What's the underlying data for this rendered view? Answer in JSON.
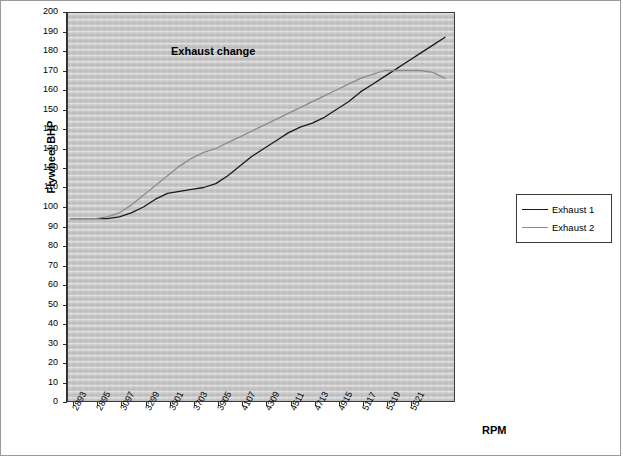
{
  "chart_data": {
    "type": "line",
    "title": "",
    "annotation": "Exhaust change",
    "xlabel": "RPM",
    "ylabel": "Flywheel BHP",
    "ylim": [
      0,
      200
    ],
    "ytick_step": 10,
    "yticks": [
      0,
      10,
      20,
      30,
      40,
      50,
      60,
      70,
      80,
      90,
      100,
      110,
      120,
      130,
      140,
      150,
      160,
      170,
      180,
      190,
      200
    ],
    "grid": false,
    "legend_position": "right",
    "categories": [
      "2893",
      "2895",
      "3097",
      "3299",
      "3501",
      "3703",
      "3905",
      "4107",
      "4309",
      "4511",
      "4713",
      "4915",
      "5117",
      "5319",
      "5521"
    ],
    "xtick_labels": [
      "2893",
      "2895",
      "3097",
      "3299",
      "3501",
      "3703",
      "3905",
      "4107",
      "4309",
      "4511",
      "4713",
      "4915",
      "5117",
      "5319",
      "5521"
    ],
    "series": [
      {
        "name": "Exhaust 1",
        "color": "#1a1a1a",
        "x": [
          0,
          1,
          2,
          3,
          4,
          5,
          6,
          7,
          8,
          9,
          10,
          11,
          12,
          13,
          14,
          15,
          16,
          17,
          18,
          19,
          20,
          21,
          22,
          23,
          24,
          25,
          26,
          27,
          28,
          29,
          30,
          31
        ],
        "values": [
          94,
          94,
          94,
          94,
          95,
          97,
          100,
          104,
          107,
          108,
          109,
          110,
          112,
          116,
          121,
          126,
          130,
          134,
          138,
          141,
          143,
          146,
          150,
          154,
          159,
          163,
          167,
          171,
          175,
          179,
          183,
          187
        ]
      },
      {
        "name": "Exhaust 2",
        "color": "#8c8c8c",
        "x": [
          0,
          1,
          2,
          3,
          4,
          5,
          6,
          7,
          8,
          9,
          10,
          11,
          12,
          13,
          14,
          15,
          16,
          17,
          18,
          19,
          20,
          21,
          22,
          23,
          24,
          25,
          26,
          27,
          28,
          29,
          30,
          31
        ],
        "values": [
          94,
          94,
          94,
          95,
          97,
          101,
          106,
          111,
          116,
          121,
          125,
          128,
          130,
          133,
          136,
          139,
          142,
          145,
          148,
          151,
          154,
          157,
          160,
          163,
          166,
          168,
          170,
          170,
          170,
          170,
          169,
          166
        ]
      }
    ]
  },
  "legend": {
    "items": [
      {
        "label": "Exhaust 1",
        "color": "#1a1a1a"
      },
      {
        "label": "Exhaust 2",
        "color": "#8c8c8c"
      }
    ]
  }
}
